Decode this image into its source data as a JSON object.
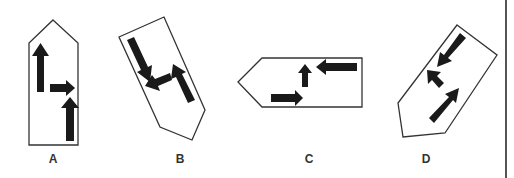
{
  "figure": {
    "type": "visual-reasoning-options",
    "colors": {
      "outline": "#333333",
      "arrow": "#1a1a1a",
      "background": "#ffffff",
      "label": "#333333",
      "divider": "#555555"
    },
    "options": [
      {
        "label": "A",
        "shape": "pentagon-pointing-up",
        "arrows": [
          "up",
          "right",
          "up"
        ]
      },
      {
        "label": "B",
        "shape": "pentagon-rotated",
        "arrows": [
          "down-right",
          "left-down",
          "up-left"
        ]
      },
      {
        "label": "C",
        "shape": "pentagon-pointing-left",
        "arrows": [
          "right",
          "up",
          "left"
        ]
      },
      {
        "label": "D",
        "shape": "pentagon-rotated",
        "arrows": [
          "down-left",
          "up-left",
          "up-right"
        ]
      }
    ]
  }
}
